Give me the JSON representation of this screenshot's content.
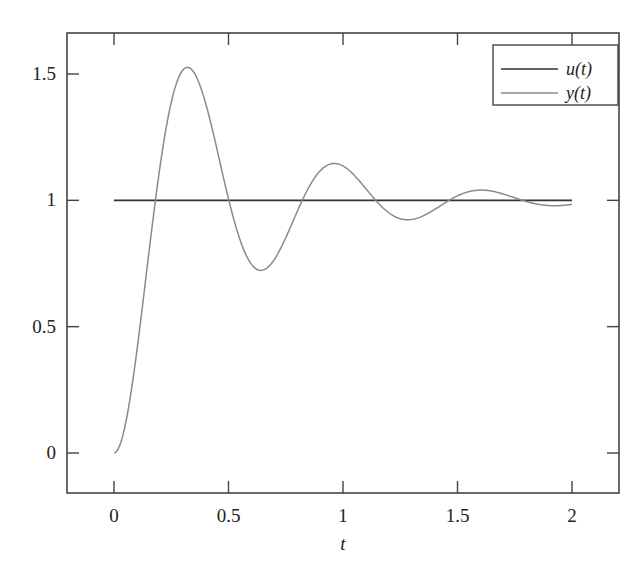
{
  "chart_data": {
    "type": "line",
    "title": "",
    "xlabel": "t",
    "ylabel": "",
    "xlim": [
      -0.2,
      2.2
    ],
    "ylim": [
      -0.15,
      1.68
    ],
    "xticks": [
      0,
      0.5,
      1,
      1.5,
      2
    ],
    "xtick_labels": [
      "0",
      "0.5",
      "1",
      "1.5",
      "2"
    ],
    "yticks": [
      0,
      0.5,
      1,
      1.5
    ],
    "ytick_labels": [
      "0",
      "0.5",
      "1",
      "1.5"
    ],
    "grid": false,
    "legend_position": "upper right",
    "series": [
      {
        "name": "u(t)",
        "color": "#333333",
        "description": "unit step input",
        "x": [
          0,
          2
        ],
        "y": [
          1,
          1
        ]
      },
      {
        "name": "y(t)",
        "color": "#8a8a8a",
        "description": "underdamped second-order step response (zeta≈0.2, wn≈10)",
        "x": [
          0,
          0.1,
          0.2,
          0.32,
          0.45,
          0.5,
          0.64,
          0.8,
          0.96,
          1.1,
          1.28,
          1.45,
          1.61,
          1.8,
          2.0
        ],
        "y": [
          0,
          0.41,
          1.05,
          1.52,
          1.21,
          1.05,
          0.72,
          0.93,
          1.14,
          1.07,
          0.92,
          0.98,
          1.03,
          0.99,
          0.98
        ],
        "zeta": 0.2,
        "wn": 10
      }
    ],
    "annotations": {
      "peak": {
        "t": 0.32,
        "y": 1.52
      },
      "first_trough": {
        "t": 0.64,
        "y": 0.72
      },
      "second_peak": {
        "t": 0.96,
        "y": 1.14
      },
      "second_trough": {
        "t": 1.28,
        "y": 0.92
      },
      "third_peak": {
        "t": 1.61,
        "y": 1.03
      }
    }
  },
  "legend": {
    "items": [
      "u(t)",
      "y(t)"
    ]
  },
  "axis": {
    "xlabel": "t"
  }
}
